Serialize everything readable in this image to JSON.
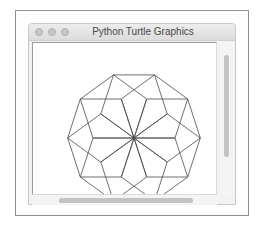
{
  "window": {
    "title": "Python Turtle Graphics",
    "traffic_lights": [
      "close-button",
      "minimize-button",
      "zoom-button"
    ]
  },
  "drawing": {
    "shape": "pentagon",
    "count": 10,
    "side_length": 41,
    "rotation_step_deg": 36,
    "center": [
      101,
      95
    ],
    "stroke_color": "#4a4a4a",
    "stroke_width": 0.8
  },
  "scrollbars": {
    "vertical": "vertical-scrollbar",
    "horizontal": "horizontal-scrollbar"
  }
}
